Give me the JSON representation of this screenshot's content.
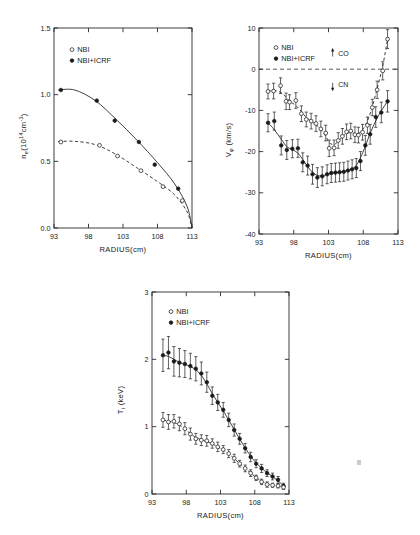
{
  "figure": {
    "panels": [
      "density-panel",
      "toroidal-rotation-panel",
      "ion-temperature-panel"
    ],
    "legend_open_label": "NBI",
    "legend_filled_label": "NBI+ICRF",
    "open_marker": "○",
    "filled_marker": "●",
    "shared_xlabel": "RADIUS(cm)"
  },
  "chart_data": [
    {
      "id": "density",
      "type": "scatter",
      "title": "",
      "xlabel": "RADIUS(cm)",
      "ylabel": "n_e(10^14 cm^-3)",
      "ylabel_parts": {
        "base": "n",
        "sub": "e",
        "open": "(10",
        "sup": "14",
        "mid": "cm",
        "sup2": "-3",
        "close": ")"
      },
      "xlim": [
        93,
        113
      ],
      "ylim": [
        0.0,
        1.5
      ],
      "xticks": [
        93,
        98,
        103,
        108,
        113
      ],
      "yticks": [
        0.0,
        0.5,
        1.0,
        1.5
      ],
      "ytick_labels": [
        "0.0",
        "0.5",
        "1.0",
        "1.5"
      ],
      "xtick_labels": [
        "93",
        "98",
        "103",
        "108",
        "113"
      ],
      "grid": false,
      "legend_position": "upper-left",
      "series": [
        {
          "name": "NBI+ICRF",
          "marker": "filled-circle",
          "line": "solid",
          "x": [
            94.0,
            99.2,
            101.8,
            105.3,
            107.6,
            111.0
          ],
          "y": [
            1.035,
            0.955,
            0.805,
            0.645,
            0.475,
            0.295
          ],
          "fit_x": [
            93.6,
            96.0,
            99.0,
            102.0,
            105.0,
            108.0,
            110.5,
            112.3,
            113.0
          ],
          "fit_y": [
            1.035,
            1.035,
            0.955,
            0.815,
            0.66,
            0.49,
            0.33,
            0.16,
            0.0
          ]
        },
        {
          "name": "NBI",
          "marker": "open-circle",
          "line": "dashed",
          "x": [
            94.0,
            99.6,
            102.2,
            105.6,
            108.8,
            111.6
          ],
          "y": [
            0.645,
            0.62,
            0.54,
            0.43,
            0.31,
            0.205
          ],
          "fit_x": [
            93.6,
            96.0,
            99.0,
            102.0,
            105.0,
            108.0,
            110.5,
            112.3,
            113.0
          ],
          "fit_y": [
            0.648,
            0.65,
            0.625,
            0.552,
            0.452,
            0.348,
            0.248,
            0.12,
            0.0
          ]
        }
      ]
    },
    {
      "id": "toroidal-rotation",
      "type": "scatter",
      "title": "",
      "xlabel": "RADIUS(cm)",
      "ylabel": "V_φ (km/s)",
      "ylabel_parts": {
        "base": "V",
        "sub": "φ",
        "unit": " (km/s)"
      },
      "xlim": [
        93,
        113
      ],
      "ylim": [
        -40,
        10
      ],
      "xticks": [
        93,
        98,
        103,
        108,
        113
      ],
      "yticks": [
        -40,
        -30,
        -20,
        -10,
        0,
        10
      ],
      "ytick_labels": [
        "-40",
        "-30",
        "-20",
        "-10",
        "0",
        "10"
      ],
      "xtick_labels": [
        "93",
        "98",
        "103",
        "108",
        "113"
      ],
      "grid": false,
      "zero_line": 0,
      "legend_position": "upper-left",
      "annotations": [
        {
          "label": "CO",
          "direction": "up",
          "x": 103.6,
          "y": 3.2
        },
        {
          "label": "CN",
          "direction": "down",
          "x": 103.6,
          "y": -3.4
        }
      ],
      "series": [
        {
          "name": "NBI",
          "marker": "open-circle",
          "line": "dashed",
          "x": [
            94.3,
            95.1,
            96.1,
            96.9,
            97.4,
            98.3,
            99.1,
            99.8,
            100.5,
            101.2,
            101.9,
            102.6,
            103.1,
            103.8,
            104.4,
            105.0,
            105.6,
            106.2,
            106.8,
            107.3,
            107.9,
            108.6,
            109.3,
            110.0,
            110.8,
            111.5
          ],
          "y": [
            -5.4,
            -5.3,
            -4.0,
            -7.8,
            -8.0,
            -7.6,
            -10.8,
            -12.2,
            -12.6,
            -13.2,
            -14.5,
            -15.5,
            -19.2,
            -19.1,
            -17.3,
            -16.3,
            -15.2,
            -15.0,
            -15.9,
            -16.0,
            -15.3,
            -13.6,
            -9.3,
            -5.0,
            -0.4,
            7.3
          ],
          "yerr": [
            1.8,
            1.9,
            1.9,
            2.0,
            1.8,
            1.9,
            1.9,
            1.8,
            1.9,
            1.9,
            1.9,
            1.9,
            2.0,
            1.9,
            1.9,
            1.9,
            1.9,
            1.9,
            1.9,
            1.9,
            1.9,
            2.0,
            2.0,
            2.1,
            2.2,
            2.3
          ]
        },
        {
          "name": "NBI+ICRF",
          "marker": "filled-circle",
          "line": "solid",
          "x": [
            94.3,
            95.2,
            96.2,
            97.0,
            97.8,
            98.6,
            99.3,
            100.0,
            100.7,
            101.4,
            102.1,
            102.8,
            103.4,
            104.0,
            104.6,
            105.2,
            105.8,
            106.4,
            107.0,
            107.6,
            108.3,
            109.0,
            109.8,
            110.6,
            111.5
          ],
          "y": [
            -13.0,
            -12.6,
            -18.5,
            -19.6,
            -19.3,
            -19.2,
            -22.6,
            -23.4,
            -25.5,
            -26.3,
            -26.0,
            -25.5,
            -25.2,
            -25.1,
            -25.0,
            -24.9,
            -24.6,
            -24.3,
            -24.0,
            -22.3,
            -18.5,
            -15.8,
            -11.6,
            -10.5,
            -7.8
          ],
          "yerr": [
            2.2,
            2.2,
            2.3,
            2.3,
            2.2,
            2.2,
            2.3,
            2.3,
            2.4,
            2.4,
            2.3,
            2.3,
            2.3,
            2.3,
            2.3,
            2.3,
            2.3,
            2.3,
            2.3,
            2.3,
            2.4,
            2.4,
            2.5,
            2.5,
            2.6
          ]
        }
      ]
    },
    {
      "id": "ion-temperature",
      "type": "scatter",
      "title": "",
      "xlabel": "RADIUS(cm)",
      "ylabel": "T_i (keV)",
      "ylabel_parts": {
        "base": "T",
        "sub": "i",
        "unit": " (keV)"
      },
      "xlim": [
        93,
        113
      ],
      "ylim": [
        0,
        3
      ],
      "xticks": [
        93,
        98,
        103,
        108,
        113
      ],
      "yticks": [
        0,
        1,
        2,
        3
      ],
      "ytick_labels": [
        "0",
        "1",
        "2",
        "3"
      ],
      "xtick_labels": [
        "93",
        "98",
        "103",
        "108",
        "113"
      ],
      "grid": false,
      "legend_position": "upper-left",
      "series": [
        {
          "name": "NBI+ICRF",
          "marker": "filled-circle",
          "line": "solid",
          "x": [
            94.6,
            95.4,
            96.2,
            97.0,
            97.8,
            98.6,
            99.4,
            100.2,
            101.0,
            101.8,
            102.6,
            103.4,
            104.2,
            105.0,
            105.8,
            106.6,
            107.4,
            108.2,
            109.0,
            109.8,
            110.6,
            111.4,
            112.2
          ],
          "y": [
            2.06,
            2.1,
            1.97,
            1.95,
            1.93,
            1.9,
            1.86,
            1.79,
            1.66,
            1.46,
            1.36,
            1.25,
            1.1,
            0.95,
            0.82,
            0.68,
            0.55,
            0.45,
            0.38,
            0.31,
            0.26,
            0.21,
            0.12
          ],
          "yerr": [
            0.24,
            0.24,
            0.22,
            0.21,
            0.2,
            0.19,
            0.18,
            0.17,
            0.15,
            0.13,
            0.12,
            0.11,
            0.1,
            0.09,
            0.08,
            0.07,
            0.07,
            0.06,
            0.06,
            0.05,
            0.05,
            0.05,
            0.04
          ]
        },
        {
          "name": "NBI",
          "marker": "open-circle",
          "line": "dashed",
          "x": [
            94.6,
            95.4,
            96.2,
            97.0,
            97.8,
            98.6,
            99.4,
            100.2,
            101.0,
            101.8,
            102.6,
            103.4,
            104.2,
            105.0,
            105.8,
            106.6,
            107.4,
            108.2,
            109.0,
            109.8,
            110.6,
            111.4,
            112.2
          ],
          "y": [
            1.1,
            1.07,
            1.08,
            1.04,
            0.97,
            0.89,
            0.82,
            0.8,
            0.79,
            0.75,
            0.7,
            0.66,
            0.6,
            0.53,
            0.45,
            0.38,
            0.31,
            0.24,
            0.18,
            0.14,
            0.13,
            0.12,
            0.1
          ],
          "yerr": [
            0.11,
            0.11,
            0.1,
            0.1,
            0.09,
            0.09,
            0.08,
            0.08,
            0.08,
            0.07,
            0.07,
            0.06,
            0.06,
            0.06,
            0.05,
            0.05,
            0.05,
            0.04,
            0.04,
            0.04,
            0.03,
            0.03,
            0.03
          ]
        }
      ]
    }
  ]
}
